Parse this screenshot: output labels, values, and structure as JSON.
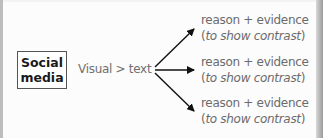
{
  "diagram": {
    "topic": {
      "line1": "Social",
      "line2": "media"
    },
    "relation": "Visual > text",
    "branches": [
      {
        "reason": "reason + evidence",
        "note_open": "(",
        "note_text": "to show contrast",
        "note_close": ")"
      },
      {
        "reason": "reason + evidence",
        "note_open": "(",
        "note_text": "to show contrast",
        "note_close": ")"
      },
      {
        "reason": "reason + evidence",
        "note_open": "(",
        "note_text": "to show contrast",
        "note_close": ")"
      }
    ],
    "arrow_count": 3,
    "colors": {
      "box_border": "#555555",
      "text": "#6b6b6b",
      "arrow": "#111111"
    }
  }
}
